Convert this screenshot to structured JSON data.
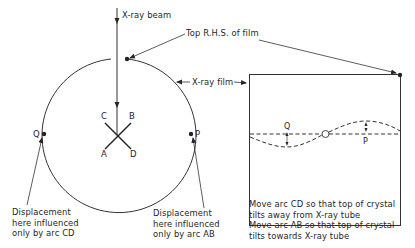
{
  "labels": {
    "beam": "X-ray beam",
    "top_rhs": "Top R.H.S. of film",
    "film": "X-ray film",
    "crystal": {
      "C": "C",
      "B": "B",
      "A": "A",
      "D": "D"
    },
    "point_q": "Q",
    "point_p": "P",
    "film_q": "Q",
    "film_p": "P",
    "disp_cd": [
      "Displacement",
      "here influenced",
      "only by arc CD"
    ],
    "disp_ab": [
      "Displacement",
      "here influenced",
      "only by arc AB"
    ],
    "instructions": [
      "Move arc CD so that top of crystal",
      "tilts away from X-ray tube",
      "Move arc AB so that top of crystal",
      "tilts towards X-ray tube"
    ]
  },
  "colors": {
    "ink": "#262626",
    "background": "#ffffff"
  }
}
